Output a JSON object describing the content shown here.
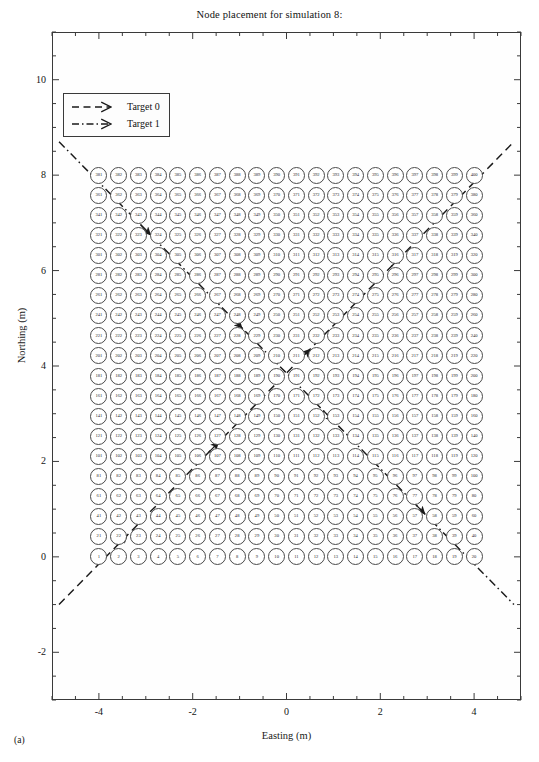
{
  "figure": {
    "title": "Node placement for simulation 8:",
    "panel_label": "(a)"
  },
  "axes": {
    "xlabel": "Easting (m)",
    "ylabel": "Northing (m)",
    "xticks": [
      "-4",
      "-2",
      "0",
      "2",
      "4"
    ],
    "yticks": [
      "-2",
      "0",
      "2",
      "4",
      "6",
      "8",
      "10"
    ]
  },
  "legend": {
    "items": [
      {
        "label": "Target 0",
        "style": "dashed",
        "color": "#1a1a1a"
      },
      {
        "label": "Target 1",
        "style": "dashdot",
        "color": "#1a1a1a"
      }
    ]
  },
  "colors": {
    "node_stroke": "#4a4a4a",
    "node_fill": "#ffffff",
    "axis": "#3a3a3a",
    "trajectory": "#1a1a1a",
    "background": "#ffffff"
  },
  "chart_data": {
    "type": "scatter",
    "title": "Node placement for simulation 8:",
    "xlabel": "Easting (m)",
    "ylabel": "Northing (m)",
    "xlim": [
      -5.0,
      5.0
    ],
    "ylim": [
      -3.0,
      11.0
    ],
    "xticks": [
      -4,
      -2,
      0,
      2,
      4
    ],
    "yticks": [
      -2,
      0,
      2,
      4,
      6,
      8,
      10
    ],
    "grid": false,
    "legend_position": "upper left",
    "nodes": {
      "count": 400,
      "rows": 20,
      "cols": 20,
      "x_start": -4.0,
      "x_end": 4.0,
      "y_start": 0.0,
      "y_end": 8.0,
      "x_spacing": 0.421,
      "y_spacing": 0.421,
      "numbering": "row-major, left-to-right, bottom-to-top, starting at 1",
      "marker": "open circle with index label",
      "first_row_labels": [
        1,
        2,
        3,
        4,
        5,
        6,
        7,
        8,
        9,
        10,
        11,
        12,
        13,
        14,
        15,
        16,
        17,
        18,
        19,
        20
      ],
      "row_start_labels": [
        1,
        21,
        41,
        61,
        81,
        101,
        121,
        141,
        161,
        181,
        201,
        221,
        241,
        261,
        281,
        301,
        321,
        341,
        361,
        381
      ],
      "last_label": 400
    },
    "series": [
      {
        "name": "Target 0",
        "type": "trajectory",
        "style": "dashed",
        "color": "#1a1a1a",
        "x": [
          -4.85,
          4.85
        ],
        "y": [
          -1.0,
          8.7
        ],
        "arrow_markers_at": [
          [
            -3.4,
            0.45
          ],
          [
            -1.45,
            2.4
          ],
          [
            0.5,
            4.35
          ],
          [
            2.45,
            6.3
          ]
        ],
        "direction": "southwest to northeast"
      },
      {
        "name": "Target 1",
        "type": "trajectory",
        "style": "dashdot",
        "color": "#1a1a1a",
        "x": [
          -4.85,
          4.85
        ],
        "y": [
          8.7,
          -1.0
        ],
        "arrow_markers_at": [
          [
            -2.9,
            6.75
          ],
          [
            -0.95,
            4.8
          ],
          [
            1.0,
            2.85
          ],
          [
            2.95,
            0.9
          ]
        ],
        "direction": "northwest to southeast"
      }
    ]
  }
}
